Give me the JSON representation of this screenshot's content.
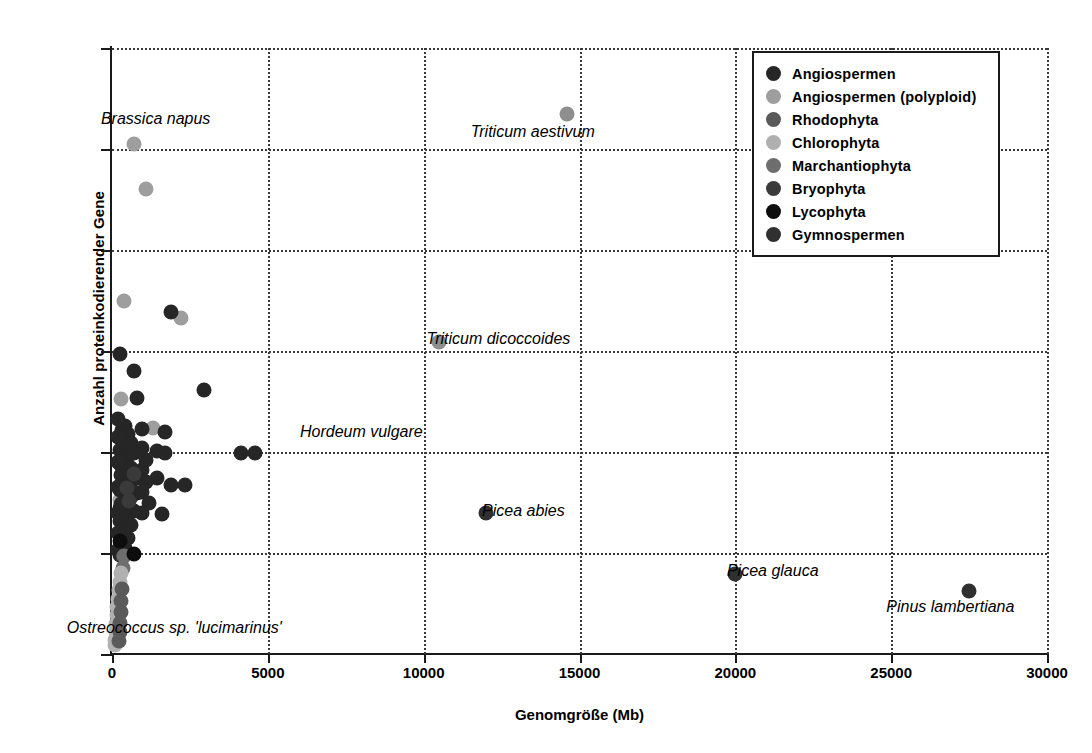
{
  "chart_data": {
    "type": "scatter",
    "title": "",
    "xlabel": "Genomgröße (Mb)",
    "ylabel": "Anzahl proteinkodierender Gene",
    "xlim": [
      0,
      30000
    ],
    "ylim": [
      0,
      120000
    ],
    "xticks": [
      "0",
      "5000",
      "10000",
      "15000",
      "20000",
      "25000",
      "30000"
    ],
    "yticks": [
      "0",
      "20000",
      "40000",
      "60000",
      "80000",
      "100000",
      "120000"
    ],
    "grid": "dotted, both axes",
    "legend_position": "top-right inside plot",
    "legend": [
      {
        "name": "Angiospermen",
        "color": "#262626"
      },
      {
        "name": "Angiospermen (polyploid)",
        "color": "#9e9e9e"
      },
      {
        "name": "Rhodophyta",
        "color": "#5a5a5a"
      },
      {
        "name": "Chlorophyta",
        "color": "#b0b0b0"
      },
      {
        "name": "Marchantiophyta",
        "color": "#6e6e6e"
      },
      {
        "name": "Bryophyta",
        "color": "#3a3a3a"
      },
      {
        "name": "Lycophyta",
        "color": "#0d0d0d"
      },
      {
        "name": "Gymnospermen",
        "color": "#303030"
      }
    ],
    "annotations": [
      {
        "text": "Brassica napus",
        "x": 1400,
        "y": 105500
      },
      {
        "text": "Triticum aestivum",
        "x": 13500,
        "y": 103000
      },
      {
        "text": "Triticum dicoccoides",
        "x": 12400,
        "y": 62000
      },
      {
        "text": "Hordeum vulgare",
        "x": 8000,
        "y": 43500
      },
      {
        "text": "Picea abies",
        "x": 13200,
        "y": 28000
      },
      {
        "text": "Picea glauca",
        "x": 21200,
        "y": 16000
      },
      {
        "text": "Pinus lambertiana",
        "x": 26900,
        "y": 9000
      },
      {
        "text": "Ostreococcus sp. 'lucimarinus'",
        "x": 2000,
        "y": 4800
      }
    ],
    "series": [
      {
        "name": "Angiospermen (polyploid)",
        "color": "#9e9e9e",
        "points": [
          [
            700,
            101000
          ],
          [
            1100,
            92000
          ],
          [
            400,
            70000
          ],
          [
            2200,
            66500
          ],
          [
            300,
            50500
          ],
          [
            1300,
            44800
          ],
          [
            400,
            33000
          ],
          [
            250,
            30500
          ]
        ]
      },
      {
        "name": "Angiospermen",
        "color": "#262626",
        "points": [
          [
            1900,
            67800
          ],
          [
            250,
            59500
          ],
          [
            700,
            56000
          ],
          [
            800,
            50700
          ],
          [
            2950,
            52200
          ],
          [
            1700,
            44000
          ],
          [
            1450,
            40200
          ],
          [
            1700,
            39800
          ],
          [
            4150,
            39900
          ],
          [
            4600,
            39800
          ],
          [
            1450,
            34800
          ],
          [
            1900,
            33400
          ],
          [
            2350,
            33400
          ],
          [
            1600,
            27800
          ],
          [
            420,
            45200
          ],
          [
            330,
            44300
          ],
          [
            520,
            43600
          ],
          [
            300,
            42500
          ],
          [
            600,
            41800
          ],
          [
            430,
            41000
          ],
          [
            250,
            40400
          ],
          [
            700,
            39900
          ],
          [
            520,
            39200
          ],
          [
            330,
            38400
          ],
          [
            250,
            37600
          ],
          [
            620,
            36900
          ],
          [
            430,
            36200
          ],
          [
            300,
            35400
          ],
          [
            700,
            34700
          ],
          [
            520,
            34000
          ],
          [
            370,
            33200
          ],
          [
            250,
            32500
          ],
          [
            800,
            31800
          ],
          [
            600,
            31100
          ],
          [
            430,
            30400
          ],
          [
            300,
            29700
          ],
          [
            250,
            29000
          ],
          [
            700,
            28400
          ],
          [
            520,
            27700
          ],
          [
            370,
            27000
          ],
          [
            260,
            26300
          ],
          [
            600,
            25600
          ],
          [
            430,
            25000
          ],
          [
            300,
            24300
          ],
          [
            250,
            23600
          ],
          [
            520,
            23000
          ],
          [
            370,
            22300
          ],
          [
            280,
            21600
          ],
          [
            430,
            21000
          ],
          [
            300,
            20300
          ],
          [
            250,
            19600
          ],
          [
            180,
            46500
          ],
          [
            180,
            43000
          ],
          [
            180,
            38000
          ],
          [
            180,
            33000
          ],
          [
            180,
            28000
          ],
          [
            180,
            24000
          ],
          [
            180,
            20500
          ],
          [
            950,
            44600
          ],
          [
            950,
            40800
          ],
          [
            950,
            36500
          ],
          [
            950,
            32000
          ],
          [
            950,
            28000
          ],
          [
            1100,
            38500
          ],
          [
            1100,
            34000
          ],
          [
            1200,
            30000
          ]
        ]
      },
      {
        "name": "Bryophyta",
        "color": "#3a3a3a",
        "points": [
          [
            480,
            32800
          ],
          [
            560,
            30200
          ],
          [
            700,
            35600
          ],
          [
            350,
            19200
          ]
        ]
      },
      {
        "name": "Marchantiophyta",
        "color": "#6e6e6e",
        "points": [
          [
            400,
            19400
          ],
          [
            350,
            17000
          ]
        ]
      },
      {
        "name": "Chlorophyta",
        "color": "#b0b0b0",
        "points": [
          [
            300,
            16000
          ],
          [
            250,
            14300
          ],
          [
            210,
            12600
          ],
          [
            180,
            10900
          ],
          [
            160,
            9300
          ],
          [
            150,
            7700
          ],
          [
            130,
            6000
          ],
          [
            120,
            4400
          ],
          [
            110,
            2800
          ],
          [
            100,
            1800
          ]
        ]
      },
      {
        "name": "Rhodophyta",
        "color": "#5a5a5a",
        "points": [
          [
            330,
            12800
          ],
          [
            300,
            10500
          ],
          [
            280,
            8300
          ],
          [
            260,
            6200
          ],
          [
            250,
            4300
          ],
          [
            240,
            2600
          ]
        ]
      },
      {
        "name": "Lycophyta",
        "color": "#0d0d0d",
        "points": [
          [
            250,
            22300
          ],
          [
            700,
            19800
          ]
        ]
      },
      {
        "name": "Gymnospermen",
        "color": "#303030",
        "points": [
          [
            12000,
            28000
          ],
          [
            20000,
            15800
          ],
          [
            27500,
            12500
          ]
        ]
      },
      {
        "name": "Labeled Angiospermen (polyploid)",
        "color": "#8e8e8e",
        "points": [
          [
            14600,
            107000
          ],
          [
            10500,
            61800
          ]
        ]
      }
    ]
  }
}
